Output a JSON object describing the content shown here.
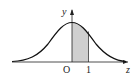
{
  "diagram": {
    "x_axis_label": "z",
    "y_axis_label": "y",
    "origin_label": "O",
    "tick_labels": [
      "1"
    ],
    "shaded_region": {
      "from": 0,
      "to": 1,
      "color": "#cfcfcf"
    },
    "curve_color": "#111111"
  }
}
